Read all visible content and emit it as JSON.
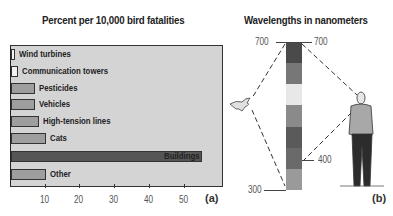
{
  "panel_a": {
    "title": "Percent per 10,000 bird fatalities",
    "label": "(a)"
  },
  "panel_b": {
    "title": "Wavelengths in nanometers",
    "label": "(b)",
    "left_top": "700",
    "right_top": "700",
    "right_mid": "400",
    "left_bottom": "300",
    "spectrum_colors": [
      "#4a4a4a",
      "#777777",
      "#e8e8e8",
      "#8a8a8a",
      "#5a5a5a",
      "#6a6a6a",
      "#9a9a9a"
    ]
  },
  "chart_data": {
    "type": "bar",
    "orientation": "horizontal",
    "title": "Percent per 10,000 bird fatalities",
    "categories": [
      "Wind turbines",
      "Communication towers",
      "Pesticides",
      "Vehicles",
      "High-tension lines",
      "Cats",
      "Buildings",
      "Other"
    ],
    "values": [
      1,
      2,
      7,
      7,
      8,
      10,
      55,
      10
    ],
    "bar_colors": [
      "#f2f2f2",
      "#f2f2f2",
      "#9e9e9e",
      "#9e9e9e",
      "#9e9e9e",
      "#9e9e9e",
      "#555555",
      "#9e9e9e"
    ],
    "xlabel": "",
    "ylabel": "",
    "xticks": [
      10,
      20,
      30,
      40,
      50
    ],
    "xlim": [
      0,
      61
    ],
    "grid": false,
    "legend": null
  }
}
